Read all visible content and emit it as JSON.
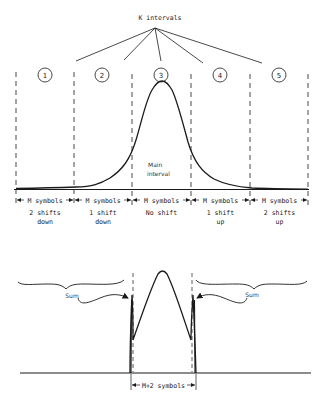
{
  "title_label": "K intervals",
  "intervals": [
    {
      "number": "1",
      "symbols_label": "M symbols",
      "shift_line1": "2 shifts",
      "shift_line2": "down"
    },
    {
      "number": "2",
      "symbols_label": "M symbols",
      "shift_line1": "1 shift",
      "shift_line2": "down"
    },
    {
      "number": "3",
      "symbols_label": "M symbols",
      "shift_line1": "No shift",
      "shift_line2": ""
    },
    {
      "number": "4",
      "symbols_label": "M symbols",
      "shift_line1": "1 shift",
      "shift_line2": "up"
    },
    {
      "number": "5",
      "symbols_label": "M symbols",
      "shift_line1": "2 shifts",
      "shift_line2": "up"
    }
  ],
  "main_interval_label_line1": "Main",
  "main_interval_label_line2": "interval",
  "bottom": {
    "sum_left": "Sum",
    "sum_right": "Sum",
    "width_label": "M+2 symbols"
  },
  "colors": {
    "stroke": "#1a1a1a",
    "dash": "#333333",
    "background": "#ffffff"
  }
}
